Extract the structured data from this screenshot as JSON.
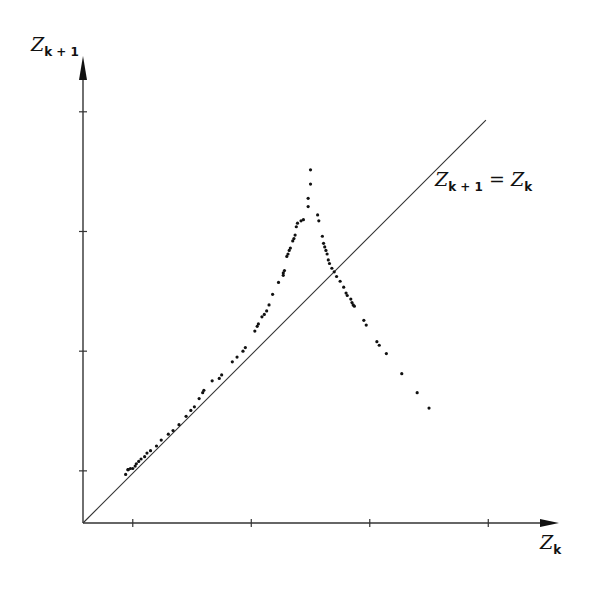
{
  "chart_data": {
    "type": "scatter",
    "title": "",
    "xlabel": "Z_k",
    "ylabel": "Z_{k+1}",
    "xlim": [
      0,
      4.0
    ],
    "ylim": [
      0,
      3.45
    ],
    "x_ticks": [
      0.42,
      1.42,
      2.42,
      3.42
    ],
    "y_ticks": [
      0.44,
      1.45,
      2.46,
      3.47
    ],
    "tick_labels_shown": false,
    "grid": false,
    "legend": null,
    "annotations": [
      {
        "text": "Z_{k+1} = Z_k",
        "kind": "identity-line-label"
      }
    ],
    "reference_line": {
      "name": "Z_{k+1} = Z_k",
      "x": [
        0,
        3.4
      ],
      "y": [
        0,
        3.4
      ]
    },
    "series": [
      {
        "name": "return map points",
        "marker": "dot",
        "points": [
          [
            0.36,
            0.41
          ],
          [
            0.38,
            0.45
          ],
          [
            0.38,
            0.45
          ],
          [
            0.4,
            0.46
          ],
          [
            0.42,
            0.46
          ],
          [
            0.44,
            0.48
          ],
          [
            0.45,
            0.5
          ],
          [
            0.47,
            0.52
          ],
          [
            0.49,
            0.54
          ],
          [
            0.52,
            0.56
          ],
          [
            0.54,
            0.59
          ],
          [
            0.57,
            0.61
          ],
          [
            0.62,
            0.65
          ],
          [
            0.66,
            0.7
          ],
          [
            0.72,
            0.75
          ],
          [
            0.76,
            0.78
          ],
          [
            0.81,
            0.83
          ],
          [
            0.87,
            0.9
          ],
          [
            0.91,
            0.95
          ],
          [
            0.94,
            0.98
          ],
          [
            0.98,
            1.05
          ],
          [
            1.01,
            1.1
          ],
          [
            1.02,
            1.12
          ],
          [
            1.09,
            1.2
          ],
          [
            1.15,
            1.22
          ],
          [
            1.17,
            1.25
          ],
          [
            1.26,
            1.36
          ],
          [
            1.3,
            1.4
          ],
          [
            1.35,
            1.45
          ],
          [
            1.37,
            1.48
          ],
          [
            1.45,
            1.62
          ],
          [
            1.47,
            1.66
          ],
          [
            1.48,
            1.68
          ],
          [
            1.51,
            1.74
          ],
          [
            1.53,
            1.76
          ],
          [
            1.55,
            1.79
          ],
          [
            1.57,
            1.84
          ],
          [
            1.6,
            1.93
          ],
          [
            1.65,
            2.03
          ],
          [
            1.69,
            2.09
          ],
          [
            1.69,
            2.11
          ],
          [
            1.7,
            2.13
          ],
          [
            1.72,
            2.25
          ],
          [
            1.73,
            2.27
          ],
          [
            1.74,
            2.3
          ],
          [
            1.75,
            2.32
          ],
          [
            1.77,
            2.38
          ],
          [
            1.78,
            2.4
          ],
          [
            1.79,
            2.43
          ],
          [
            1.8,
            2.5
          ],
          [
            1.81,
            2.53
          ],
          [
            1.84,
            2.55
          ],
          [
            1.86,
            2.56
          ],
          [
            1.9,
            2.67
          ],
          [
            1.9,
            2.74
          ],
          [
            1.92,
            2.86
          ],
          [
            1.92,
            2.98
          ],
          [
            1.98,
            2.6
          ],
          [
            1.99,
            2.55
          ],
          [
            2.02,
            2.42
          ],
          [
            2.03,
            2.36
          ],
          [
            2.04,
            2.33
          ],
          [
            2.05,
            2.3
          ],
          [
            2.06,
            2.27
          ],
          [
            2.07,
            2.22
          ],
          [
            2.08,
            2.19
          ],
          [
            2.1,
            2.15
          ],
          [
            2.12,
            2.12
          ],
          [
            2.14,
            2.08
          ],
          [
            2.17,
            2.04
          ],
          [
            2.2,
            1.99
          ],
          [
            2.22,
            1.94
          ],
          [
            2.23,
            1.92
          ],
          [
            2.26,
            1.89
          ],
          [
            2.27,
            1.86
          ],
          [
            2.28,
            1.84
          ],
          [
            2.29,
            1.83
          ],
          [
            2.37,
            1.71
          ],
          [
            2.39,
            1.67
          ],
          [
            2.48,
            1.53
          ],
          [
            2.5,
            1.5
          ],
          [
            2.56,
            1.43
          ],
          [
            2.69,
            1.26
          ],
          [
            2.82,
            1.1
          ],
          [
            2.92,
            0.97
          ]
        ]
      }
    ],
    "pixel_frame": {
      "origin": [
        83,
        523
      ],
      "unit_px": 118.5
    }
  },
  "labels": {
    "y_axis": {
      "base": "Z",
      "sub": "k + 1"
    },
    "x_axis": {
      "base": "Z",
      "sub": "k"
    },
    "identity": {
      "lhs_base": "Z",
      "lhs_sub": "k + 1",
      "eq": " = ",
      "rhs_base": "Z",
      "rhs_sub": "k"
    }
  },
  "style": {
    "ink": "#111111",
    "line": "#333333",
    "background": "#ffffff"
  }
}
